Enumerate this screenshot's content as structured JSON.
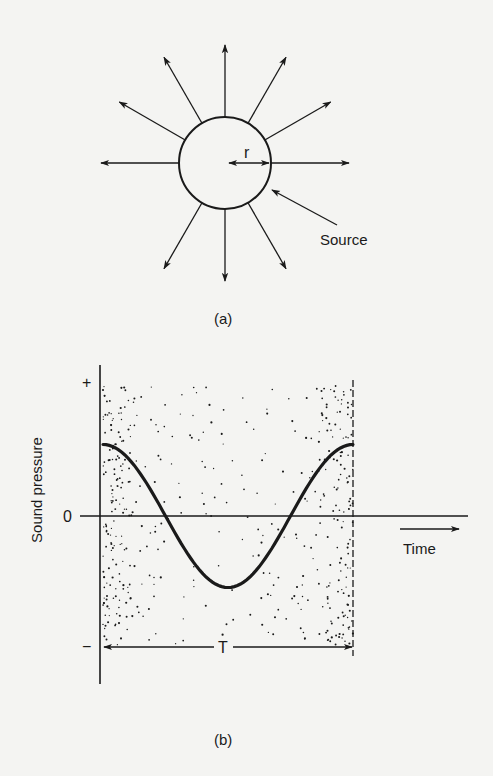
{
  "figure_a": {
    "caption": "(a)",
    "radius_label": "r",
    "source_label": "Source",
    "circle": {
      "cx": 225,
      "cy": 163,
      "r": 46
    },
    "ray_angles_deg": [
      0,
      30,
      60,
      90,
      120,
      150,
      180,
      240,
      270,
      300
    ]
  },
  "figure_b": {
    "caption": "(b)",
    "y_axis_label": "Sound pressure",
    "x_axis_label": "Time",
    "y_ticks": {
      "plus": "+",
      "zero": "0",
      "minus": "−"
    },
    "period_label": "T"
  },
  "chart_data": {
    "type": "line",
    "title": "",
    "xlabel": "Time",
    "ylabel": "Sound pressure",
    "x": [
      0,
      0.125,
      0.25,
      0.375,
      0.5,
      0.625,
      0.75,
      0.875,
      1.0
    ],
    "values": [
      0.55,
      0.39,
      0.0,
      -0.39,
      -0.55,
      -0.39,
      0.0,
      0.39,
      0.55
    ],
    "x_units": "fraction of period T",
    "ylim": [
      -1,
      1
    ],
    "y_tick_labels": [
      "−",
      "0",
      "+"
    ],
    "annotations": [
      "T (one period)"
    ]
  },
  "colors": {
    "ink": "#1a1a1a",
    "paper": "#f4f4f2"
  }
}
